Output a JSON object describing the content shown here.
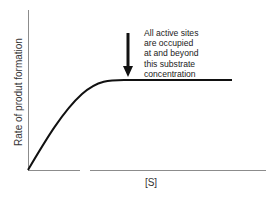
{
  "chart_data": {
    "type": "line",
    "title": "",
    "xlabel": "[S]",
    "ylabel": "Rate of produt formation",
    "grid": false,
    "legend": null,
    "xticks": [],
    "yticks": [],
    "series": [
      {
        "name": "Enzyme saturation curve",
        "description": "Rate rises nearly linearly with substrate concentration, then levels off to a plateau (saturation).",
        "shape": "linear-rise-then-plateau",
        "color": "#111111"
      }
    ],
    "annotations": [
      {
        "type": "arrow",
        "direction": "down",
        "points_to": "start of plateau",
        "text_lines": [
          "All active sites",
          "are occupied",
          "at and beyond",
          "this substrate",
          "concentration"
        ]
      }
    ]
  },
  "axes": {
    "x_label": "[S]",
    "y_label": "Rate of produt formation",
    "axis_color": "#8c8c8c"
  },
  "curve": {
    "color": "#111111",
    "path": "M28,170 C44,143 62,112 82,94 C98,80 110,80 124,80 L232,80"
  },
  "arrow": {
    "color": "#111111",
    "x": 128,
    "y_start": 33,
    "y_end": 77
  },
  "annotation": {
    "lines": [
      "All active sites",
      "are occupied",
      "at and beyond",
      "this substrate",
      "concentration"
    ]
  }
}
